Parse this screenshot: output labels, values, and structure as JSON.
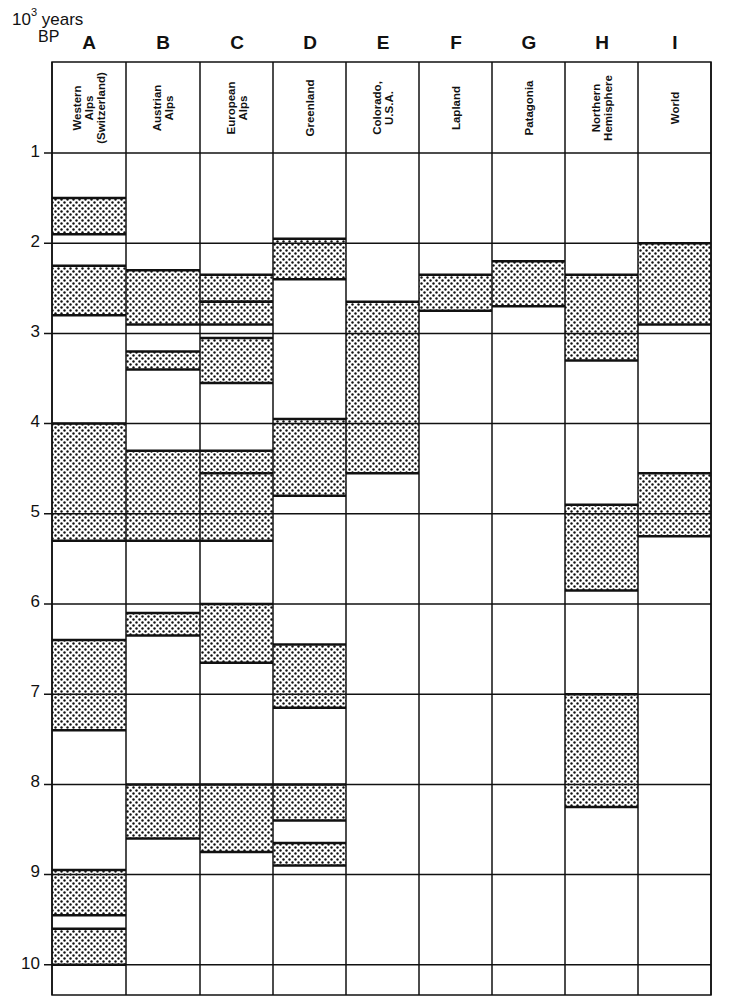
{
  "axis": {
    "unit_label": "10",
    "unit_exponent": "3",
    "unit_suffix": "years",
    "unit_line2": "BP",
    "ticks": [
      "1",
      "2",
      "3",
      "4",
      "5",
      "6",
      "7",
      "8",
      "9",
      "10"
    ]
  },
  "chart_data": {
    "type": "table",
    "title": "",
    "ylabel": "10^3 years BP",
    "ylim": [
      1,
      10.3
    ],
    "y_direction": "down",
    "grid": true,
    "legend": "dotted bands = periods of glacier advance",
    "columns": [
      {
        "letter": "A",
        "name": "Western Alps (Switzerland)",
        "bands": [
          [
            1.5,
            1.9
          ],
          [
            2.25,
            2.8
          ],
          [
            4.0,
            5.3
          ],
          [
            6.4,
            7.4
          ],
          [
            8.95,
            9.45
          ],
          [
            9.6,
            10.0
          ]
        ]
      },
      {
        "letter": "B",
        "name": "Austrian Alps",
        "bands": [
          [
            2.3,
            2.9
          ],
          [
            3.2,
            3.4
          ],
          [
            4.3,
            5.3
          ],
          [
            6.1,
            6.35
          ],
          [
            8.0,
            8.6
          ]
        ]
      },
      {
        "letter": "C",
        "name": "European Alps",
        "bands": [
          [
            2.35,
            2.65
          ],
          [
            2.65,
            2.9
          ],
          [
            3.05,
            3.55
          ],
          [
            4.3,
            4.55
          ],
          [
            4.55,
            5.3
          ],
          [
            6.0,
            6.65
          ],
          [
            8.0,
            8.75
          ]
        ]
      },
      {
        "letter": "D",
        "name": "Greenland",
        "bands": [
          [
            1.95,
            2.4
          ],
          [
            3.95,
            4.8
          ],
          [
            6.45,
            7.15
          ],
          [
            8.0,
            8.4
          ],
          [
            8.65,
            8.9
          ]
        ]
      },
      {
        "letter": "E",
        "name": "Colorado, U.S.A.",
        "bands": [
          [
            2.65,
            4.55
          ]
        ]
      },
      {
        "letter": "F",
        "name": "Lapland",
        "bands": [
          [
            2.35,
            2.75
          ]
        ]
      },
      {
        "letter": "G",
        "name": "Patagonia",
        "bands": [
          [
            2.2,
            2.7
          ]
        ]
      },
      {
        "letter": "H",
        "name": "Northern Hemisphere",
        "bands": [
          [
            2.35,
            3.3
          ],
          [
            4.9,
            5.85
          ],
          [
            7.0,
            8.25
          ]
        ]
      },
      {
        "letter": "I",
        "name": "World",
        "bands": [
          [
            2.0,
            2.9
          ],
          [
            4.55,
            5.25
          ]
        ]
      }
    ]
  },
  "columns": [
    {
      "letter": "A",
      "label": "Western\nAlps\n(Switzerland)"
    },
    {
      "letter": "B",
      "label": "Austrian\nAlps"
    },
    {
      "letter": "C",
      "label": "European\nAlps"
    },
    {
      "letter": "D",
      "label": "Greenland"
    },
    {
      "letter": "E",
      "label": "Colorado,\nU.S.A."
    },
    {
      "letter": "F",
      "label": "Lapland"
    },
    {
      "letter": "G",
      "label": "Patagonia"
    },
    {
      "letter": "H",
      "label": "Northern\nHemisphere"
    },
    {
      "letter": "I",
      "label": "World"
    }
  ]
}
